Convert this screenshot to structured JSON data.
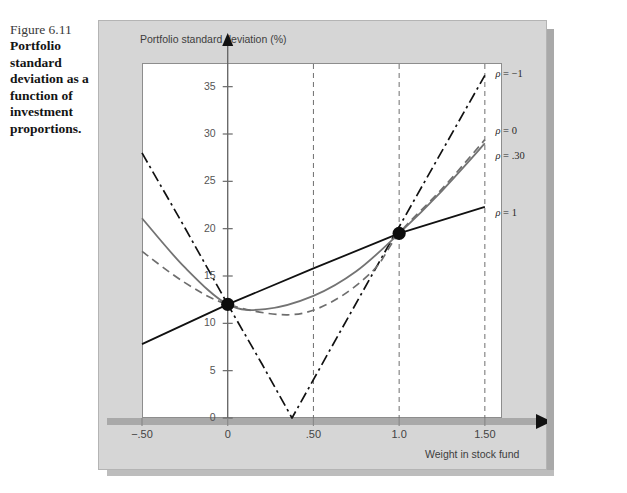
{
  "figure": {
    "number": "Figure 6.11",
    "caption": "Portfolio standard deviation as a function of investment proportions."
  },
  "chart_data": {
    "type": "line",
    "title": "",
    "xlabel": "Weight in stock fund",
    "ylabel": "Portfolio standard deviation (%)",
    "xlim": [
      -0.5,
      1.6
    ],
    "ylim": [
      0,
      37.5
    ],
    "xticks": [
      -0.5,
      0,
      0.5,
      1.0,
      1.5
    ],
    "xticklabels": [
      "−.50",
      "0",
      ".50",
      "1.0",
      "1.50"
    ],
    "yticks": [
      0,
      5,
      10,
      15,
      20,
      25,
      30,
      35
    ],
    "yticklabels": [
      "0",
      "5",
      "10",
      "15",
      "20",
      "25",
      "30",
      "35"
    ],
    "grid": "vertical-dashed-at-0.5-1.0-1.5",
    "legend_position": "right-inline-annotations",
    "markers": [
      {
        "x": 0.0,
        "y": 12.0,
        "label": "bond-fund-point"
      },
      {
        "x": 1.0,
        "y": 19.5,
        "label": "stock-fund-point"
      }
    ],
    "series": [
      {
        "name": "ρ = −1",
        "label": "ρ = −1",
        "style": "dash-dot",
        "color": "#111111",
        "x": [
          -0.5,
          -0.25,
          0.0,
          0.2,
          0.375,
          0.6,
          0.9,
          1.2,
          1.5
        ],
        "values": [
          28.0,
          20.1,
          12.0,
          5.7,
          0.0,
          7.3,
          17.0,
          26.6,
          36.2
        ]
      },
      {
        "name": "ρ = 0",
        "label": "ρ = 0",
        "style": "solid",
        "color": "#737373",
        "x": [
          -0.5,
          -0.25,
          0.0,
          0.22,
          0.5,
          0.75,
          1.0,
          1.25,
          1.5
        ],
        "values": [
          21.1,
          15.9,
          12.0,
          11.5,
          12.9,
          15.5,
          19.5,
          24.0,
          29.0
        ]
      },
      {
        "name": "ρ = .30",
        "label": "ρ = .30",
        "style": "dashed",
        "color": "#6e6e6e",
        "x": [
          -0.5,
          -0.25,
          0.0,
          0.35,
          0.6,
          0.85,
          1.0,
          1.25,
          1.5
        ],
        "values": [
          17.6,
          14.3,
          12.0,
          10.9,
          12.2,
          15.6,
          19.5,
          24.2,
          29.4
        ]
      },
      {
        "name": "ρ = 1",
        "label": "ρ = 1",
        "style": "solid",
        "color": "#111111",
        "x": [
          -0.5,
          0.0,
          0.5,
          1.0,
          1.5
        ],
        "values": [
          7.8,
          12.0,
          15.8,
          19.5,
          22.3
        ]
      }
    ],
    "annotations": [
      {
        "text": "ρ = −1",
        "x": 1.55,
        "y": 36.2
      },
      {
        "text": "ρ = 0",
        "x": 1.55,
        "y": 30.2
      },
      {
        "text": "ρ = .30",
        "x": 1.55,
        "y": 27.6
      },
      {
        "text": "ρ = 1",
        "x": 1.55,
        "y": 21.5
      }
    ]
  }
}
